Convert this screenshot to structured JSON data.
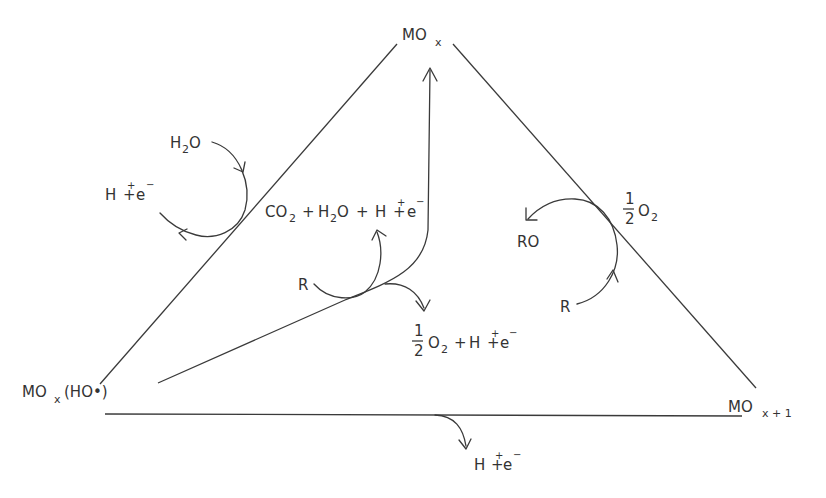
{
  "diagram": {
    "nodes": {
      "top": {
        "main": "MO",
        "sub": "x"
      },
      "bottom_left": {
        "main": "MO",
        "sub": "x",
        "suffix": "(HO•)"
      },
      "bottom_right": {
        "main": "MO",
        "sub": "x + 1"
      }
    },
    "left_cycle": {
      "input": {
        "h": "H",
        "sub": "2",
        "o": "O"
      },
      "output": {
        "h": "H",
        "plus_sup": "+",
        "plus": "+",
        "e": "e",
        "minus_sup": "−"
      }
    },
    "center": {
      "reactant": "R",
      "product_top": {
        "co": "CO",
        "co_sub": "2",
        "plus1": "+",
        "h": "H",
        "h_sub": "2",
        "o": "O",
        "plus2": "+",
        "h2": "H",
        "plus_sup": "+",
        "plus3": "+",
        "e": "e",
        "minus_sup": "−"
      },
      "product_bottom": {
        "num": "1",
        "den": "2",
        "o": "O",
        "o_sub": "2",
        "plus1": "+",
        "h": "H",
        "plus_sup": "+",
        "plus2": "+",
        "e": "e",
        "minus_sup": "−"
      }
    },
    "right_cycle": {
      "input": "R",
      "output": "RO",
      "oxygen": {
        "num": "1",
        "den": "2",
        "o": "O",
        "o_sub": "2"
      }
    },
    "bottom": {
      "output": {
        "h": "H",
        "plus_sup": "+",
        "plus": "+",
        "e": "e",
        "minus_sup": "−"
      }
    }
  }
}
